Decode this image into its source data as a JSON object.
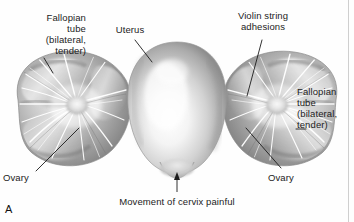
{
  "figure": {
    "panel_letter": "A",
    "background_color": "#fefefe",
    "ink_color": "#1c1c1c"
  },
  "labels": {
    "fallopian_tube_left": "Fallopian\ntube\n(bilateral,\ntender)",
    "uterus": "Uterus",
    "violin_string_adhesions": "Violin string\nadhesions",
    "fallopian_tube_right": "Fallopian\ntube\n(bilateral,\ntender)",
    "ovary_left": "Ovary",
    "ovary_right": "Ovary",
    "cervix_note": "Movement of cervix painful"
  },
  "structures": {
    "uterus_name": "uterus-body",
    "left_adnexa_name": "left-adnexal-mass",
    "right_adnexa_name": "right-adnexal-mass",
    "left_ovary_name": "left-ovary",
    "right_ovary_name": "right-ovary",
    "adhesion_name": "violin-string-adhesion-strands",
    "cervix_name": "cervix"
  },
  "colors": {
    "tissue_mid": "#a8a8a8",
    "tissue_dark": "#6f6f6f",
    "tissue_light": "#e8e8e8",
    "highlight": "#ffffff",
    "outline": "#8d8d8d",
    "leader": "#1c1c1c",
    "page_edge": "#cfcfcf"
  }
}
